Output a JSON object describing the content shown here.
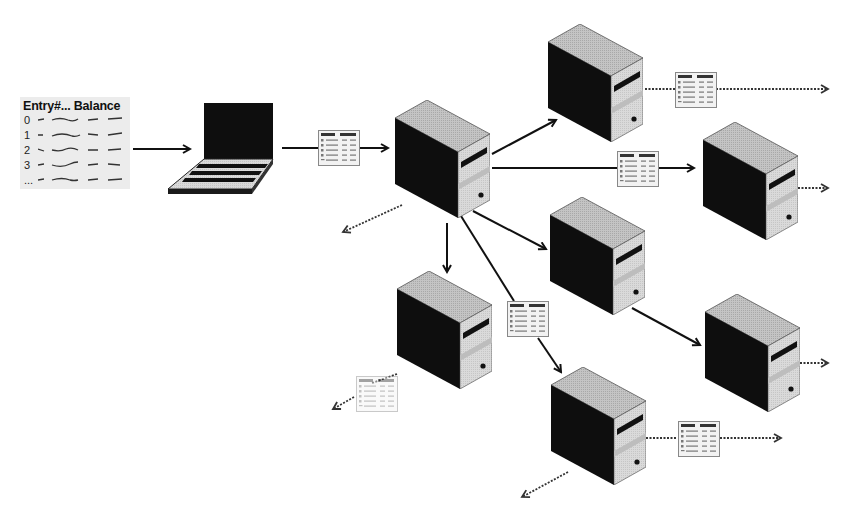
{
  "diagram": {
    "type": "distributed-ledger-replication",
    "source_ledger": {
      "header": "Entry#... Balance",
      "rows": [
        {
          "index": "0"
        },
        {
          "index": "1"
        },
        {
          "index": "2"
        },
        {
          "index": "3"
        },
        {
          "index": "..."
        }
      ]
    },
    "mini_ledger_header": "Entry#... Balance",
    "nodes": [
      {
        "id": "laptop",
        "kind": "laptop"
      },
      {
        "id": "server-center",
        "kind": "server"
      },
      {
        "id": "server-top",
        "kind": "server"
      },
      {
        "id": "server-right-upper",
        "kind": "server"
      },
      {
        "id": "server-middle",
        "kind": "server"
      },
      {
        "id": "server-lower-left",
        "kind": "server"
      },
      {
        "id": "server-right-lower",
        "kind": "server"
      },
      {
        "id": "server-bottom",
        "kind": "server"
      }
    ],
    "edges": [
      {
        "from": "source_ledger",
        "to": "laptop",
        "style": "solid"
      },
      {
        "from": "laptop",
        "to": "server-center",
        "style": "solid",
        "carries_ledger": true
      },
      {
        "from": "server-center",
        "to": "server-top",
        "style": "solid"
      },
      {
        "from": "server-center",
        "to": "server-right-upper",
        "style": "solid",
        "carries_ledger": true
      },
      {
        "from": "server-center",
        "to": "server-middle",
        "style": "solid"
      },
      {
        "from": "server-center",
        "to": "server-lower-left",
        "style": "solid"
      },
      {
        "from": "server-center",
        "to": "server-bottom",
        "style": "solid",
        "carries_ledger": true
      },
      {
        "from": "server-middle",
        "to": "server-right-lower",
        "style": "solid"
      },
      {
        "from": "server-center",
        "to": "offscreen",
        "style": "dotted"
      },
      {
        "from": "server-top",
        "to": "offscreen",
        "style": "dotted",
        "carries_ledger": true
      },
      {
        "from": "server-right-upper",
        "to": "offscreen",
        "style": "dotted"
      },
      {
        "from": "server-lower-left",
        "to": "offscreen",
        "style": "dotted",
        "carries_ledger": true
      },
      {
        "from": "server-right-lower",
        "to": "offscreen",
        "style": "dotted"
      },
      {
        "from": "server-bottom",
        "to": "offscreen",
        "style": "dotted",
        "carries_ledger": true
      },
      {
        "from": "server-bottom",
        "to": "offscreen-left",
        "style": "dotted"
      }
    ]
  },
  "colors": {
    "ink": "#111111",
    "server_top": "#bdbdbd",
    "server_side": "#0e0e0e",
    "server_front": "#d6d6d6",
    "ledger_bg": "#ececec",
    "card_bg": "#f2f2f2"
  }
}
